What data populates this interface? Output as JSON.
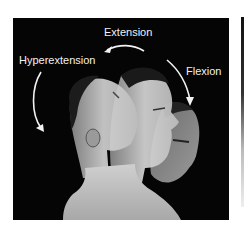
{
  "figure": {
    "labels": {
      "extension": "Extension",
      "hyperextension": "Hyperextension",
      "flexion": "Flexion"
    },
    "arrows": [
      {
        "name": "extension-arrow",
        "direction": "right-to-left"
      },
      {
        "name": "hyperextension-arrow",
        "direction": "downward"
      },
      {
        "name": "flexion-arrow",
        "direction": "downward"
      }
    ],
    "colors": {
      "background": "#050505",
      "text": "#f2f2f2",
      "arrow": "#f2f2f2",
      "page": "#ffffff"
    }
  }
}
